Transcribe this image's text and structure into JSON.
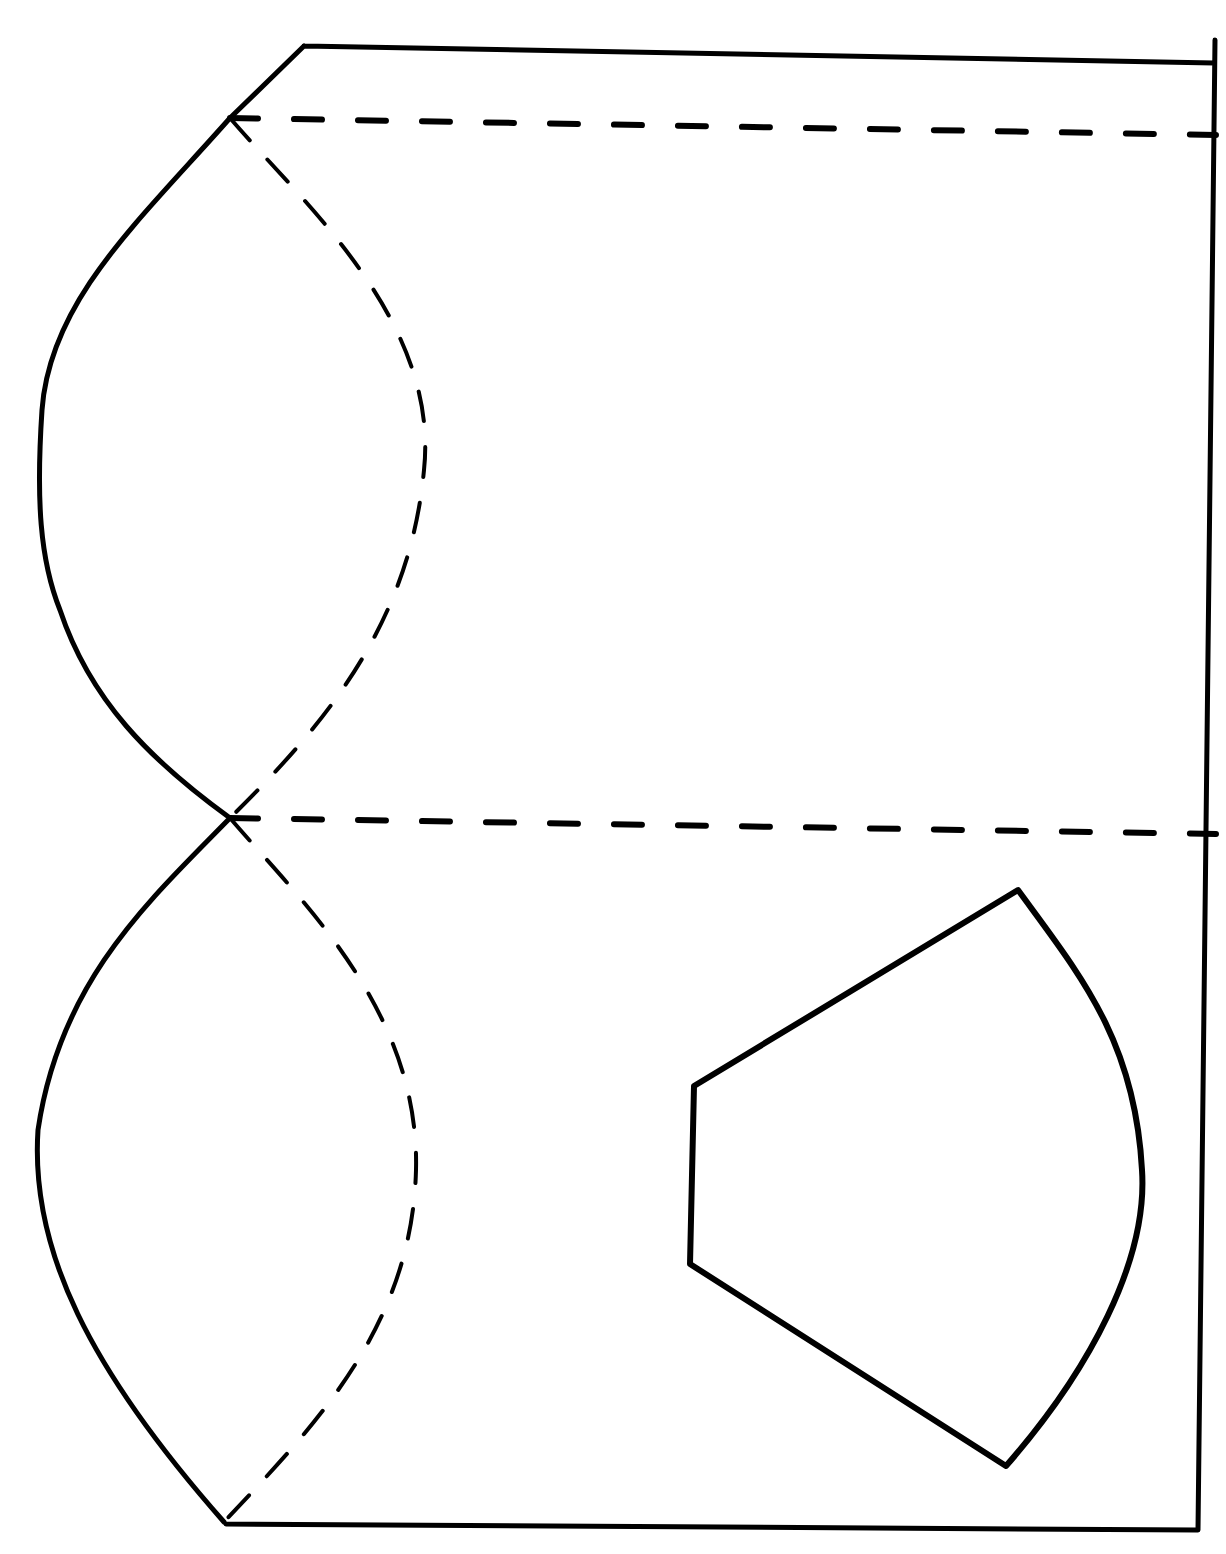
{
  "diagram": {
    "title": "",
    "background": "#ffffff",
    "stroke_color": "#000000",
    "paths": {
      "outline": "M 226 1524 L 1196 1530 M 1215 40 L 1198 1530 M 304 46 L 1214 63 M 304 46 L 230 118 C 140 220 50 300 42 410 C 36 500 40 560 60 610 C 90 700 150 760 230 818 C 150 900 60 980 38 1130 C 30 1250 90 1370 224 1522",
      "upper_dashed_curve": "M 230 118 C 300 200 440 320 424 470 C 410 620 330 720 230 818",
      "lower_dashed_curve": "M 230 818 C 300 900 420 1010 416 1170 C 412 1330 310 1430 224 1522",
      "top_fold_line": "M 230 118 L 1216 135",
      "middle_fold_line": "M 230 818 L 1216 834",
      "fan_piece": "M 694 1086 L 1018 890 C 1080 975 1135 1040 1142 1170 C 1148 1260 1090 1370 1006 1466 L 690 1264 Z"
    },
    "labels": {
      "fold_lines": "dashed",
      "cut_lines": "solid"
    }
  }
}
